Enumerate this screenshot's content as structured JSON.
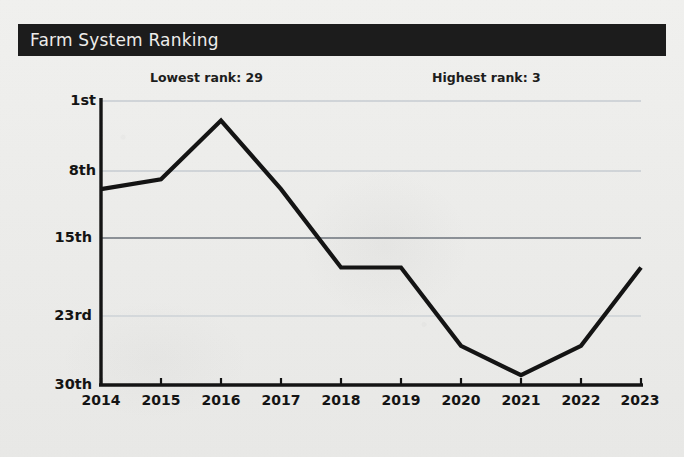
{
  "card": {
    "title": "Farm System Ranking"
  },
  "annotations": {
    "lowest": "Lowest rank: 29",
    "highest": "Highest rank: 3"
  },
  "colors": {
    "title_bar": "#1c1c1c",
    "title_text": "#f0efed",
    "line": "#141414",
    "axis": "#141414",
    "gridline_light": "#cfd4d8",
    "gridline_dark": "#8d9298",
    "background": "#eeeeec"
  },
  "chart_data": {
    "type": "line",
    "title": "Farm System Ranking",
    "xlabel": "",
    "ylabel": "",
    "x": [
      2014,
      2015,
      2016,
      2017,
      2018,
      2019,
      2020,
      2021,
      2022,
      2023
    ],
    "categories": [
      "2014",
      "2015",
      "2016",
      "2017",
      "2018",
      "2019",
      "2020",
      "2021",
      "2022",
      "2023"
    ],
    "values": [
      10,
      9,
      3,
      10,
      18,
      18,
      26,
      29,
      26,
      18
    ],
    "series": [
      {
        "name": "Farm System Ranking",
        "values": [
          10,
          9,
          3,
          10,
          18,
          18,
          26,
          29,
          26,
          18
        ]
      }
    ],
    "ytick_labels": [
      "1st",
      "8th",
      "15th",
      "23rd",
      "30th"
    ],
    "ytick_values": [
      1,
      8,
      15,
      23,
      30
    ],
    "ylim": [
      1,
      30
    ],
    "y_inverted": true,
    "xlim": [
      2014,
      2023
    ],
    "grid": true,
    "legend": false,
    "annotations": [
      "Lowest rank: 29",
      "Highest rank: 3"
    ],
    "highest_rank": 3,
    "lowest_rank": 29
  }
}
